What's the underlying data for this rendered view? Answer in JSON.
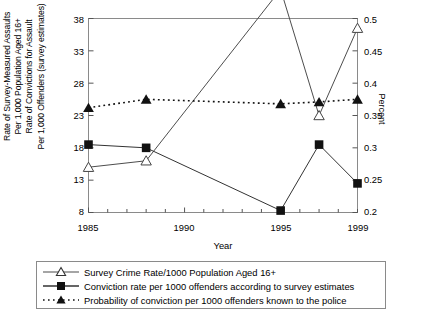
{
  "axes": {
    "y_left_label": "Rate of Survey-Measured Assaults\nPer 1,000 Population Aged 16+\nRate of Convictions for Assault\nPer 1,000 Offenders (survey estimates)",
    "y_right_label": "Percent",
    "x_label": "Year",
    "y_left_ticks": [
      "8",
      "13",
      "18",
      "23",
      "28",
      "33",
      "38"
    ],
    "y_right_ticks": [
      "0.2",
      "0.25",
      "0.3",
      "0.35",
      "0.4",
      "0.45",
      "0.5"
    ],
    "x_ticks": [
      "1985",
      "1990",
      "1995",
      "1999"
    ]
  },
  "legend": {
    "items": [
      {
        "marker": "open-triangle-line",
        "label": "Survey Crime Rate/1000 Population Aged 16+"
      },
      {
        "marker": "filled-square-line",
        "label": "Conviction rate per 1000 offenders according to survey estimates"
      },
      {
        "marker": "filled-triangle-dotted",
        "label": "Probability of conviction per 1000 offenders known to the police"
      }
    ]
  },
  "chart_data": {
    "type": "line",
    "title": "",
    "xlabel": "Year",
    "ylabel": "Rate of Survey-Measured Assaults Per 1,000 Population Aged 16+ / Rate of Convictions for Assault Per 1,000 Offenders (survey estimates)",
    "ylabel_secondary": "Percent",
    "x": [
      1985,
      1988,
      1995,
      1997,
      1999
    ],
    "xlim": [
      1985,
      1999
    ],
    "ylim": [
      8,
      38
    ],
    "ylim_secondary": [
      0.2,
      0.5
    ],
    "grid": false,
    "legend_position": "below",
    "series": [
      {
        "name": "Survey Crime Rate/1000 Population Aged 16+",
        "axis": "left",
        "marker": "open-triangle",
        "line": "solid",
        "values": [
          15.0,
          16.0,
          42.5,
          23.0,
          36.5
        ]
      },
      {
        "name": "Conviction rate per 1000 offenders according to survey estimates",
        "axis": "left",
        "marker": "filled-square",
        "line": "solid",
        "values": [
          18.5,
          18.0,
          8.3,
          18.5,
          12.5
        ]
      },
      {
        "name": "Probability of conviction per 1000 offenders known to the police",
        "axis": "right",
        "marker": "filled-triangle",
        "line": "dotted",
        "values": [
          0.362,
          0.375,
          0.368,
          0.371,
          0.375
        ]
      }
    ]
  },
  "colors": {
    "line": "#4d4d4d",
    "marker": "#000000",
    "axis": "#555555",
    "frame": "#8a8a8a"
  }
}
